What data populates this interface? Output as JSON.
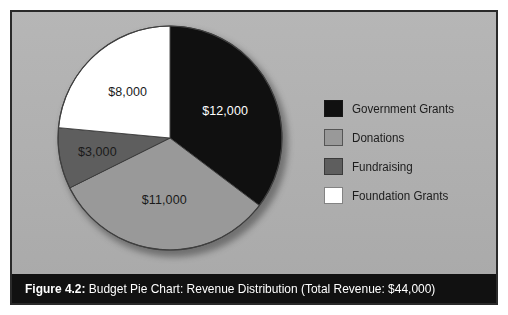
{
  "figure": {
    "number_label": "Figure 4.2:",
    "caption": " Budget Pie Chart: Revenue Distribution (Total Revenue: $44,000)"
  },
  "panel": {
    "background_color": "#b2b2b2",
    "border_color": "#2a2a2a",
    "caption_bar_color": "#111111"
  },
  "legend": {
    "items": [
      {
        "label": "Government Grants",
        "color": "#101010"
      },
      {
        "label": "Donations",
        "color": "#999999"
      },
      {
        "label": "Fundraising",
        "color": "#5e5e5e"
      },
      {
        "label": "Foundation Grants",
        "color": "#ffffff"
      }
    ]
  },
  "chart_data": {
    "type": "pie",
    "title": "Budget Pie Chart: Revenue Distribution",
    "total_label": "Total Revenue: $44,000",
    "total": 44000,
    "currency": "$",
    "start_angle_deg": 0,
    "direction": "clockwise",
    "legend_position": "right",
    "grid": false,
    "categories": [
      "Government Grants",
      "Donations",
      "Fundraising",
      "Foundation Grants"
    ],
    "values": [
      12000,
      11000,
      3000,
      8000
    ],
    "data_labels": [
      "$12,000",
      "$11,000",
      "$3,000",
      "$8,000"
    ],
    "colors": [
      "#101010",
      "#999999",
      "#5e5e5e",
      "#ffffff"
    ],
    "label_text_colors": [
      "#ffffff",
      "#1a1a1a",
      "#1a1a1a",
      "#1a1a1a"
    ],
    "slices": [
      {
        "name": "Government Grants",
        "value": 12000,
        "label": "$12,000",
        "angle_deg": 98.2,
        "percent": 27.3,
        "color": "#101010",
        "label_color": "#ffffff"
      },
      {
        "name": "Donations",
        "value": 11000,
        "label": "$11,000",
        "angle_deg": 90.0,
        "percent": 25.0,
        "color": "#999999",
        "label_color": "#1a1a1a"
      },
      {
        "name": "Fundraising",
        "value": 3000,
        "label": "$3,000",
        "angle_deg": 24.5,
        "percent": 6.8,
        "color": "#5e5e5e",
        "label_color": "#1a1a1a"
      },
      {
        "name": "Foundation Grants",
        "value": 8000,
        "label": "$8,000",
        "angle_deg": 65.5,
        "percent": 18.2,
        "color": "#ffffff",
        "label_color": "#1a1a1a"
      }
    ]
  }
}
